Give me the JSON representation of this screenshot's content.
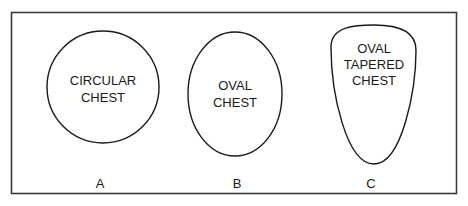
{
  "figure": {
    "stroke_color": "#1a1a1a",
    "background": "#ffffff",
    "panels": [
      {
        "id": "A",
        "shape": "circle",
        "label_lines": [
          "CIRCULAR",
          "CHEST"
        ],
        "letter": "A"
      },
      {
        "id": "B",
        "shape": "ellipse",
        "label_lines": [
          "OVAL",
          "CHEST"
        ],
        "letter": "B"
      },
      {
        "id": "C",
        "shape": "tapered-oval",
        "label_lines": [
          "OVAL",
          "TAPERED",
          "CHEST"
        ],
        "letter": "C"
      }
    ]
  }
}
